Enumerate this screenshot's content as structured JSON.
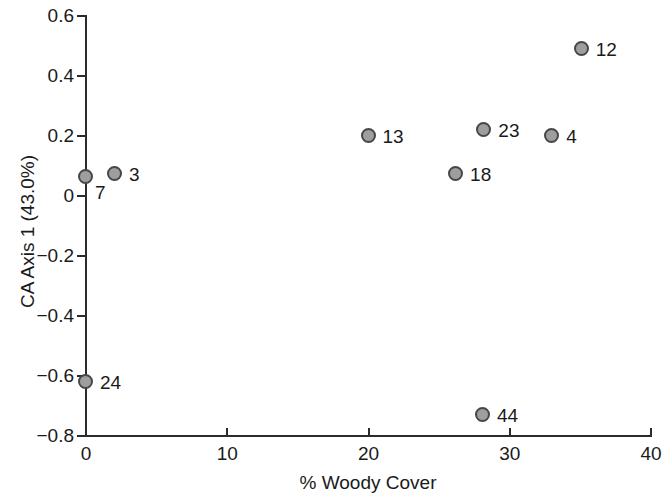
{
  "chart_data": {
    "type": "scatter",
    "title": "",
    "xlabel": "% Woody Cover",
    "ylabel": "CA Axis 1 (43.0%)",
    "xlim": [
      0,
      40
    ],
    "ylim": [
      -0.8,
      0.6
    ],
    "xticks": [
      "0",
      "10",
      "20",
      "30",
      "40"
    ],
    "xtick_values": [
      0,
      10,
      20,
      30,
      40
    ],
    "yticks": [
      "0.6",
      "0.4",
      "0.2",
      "0",
      "−0.2",
      "−0.4",
      "−0.6",
      "−0.8"
    ],
    "ytick_values": [
      0.6,
      0.4,
      0.2,
      0,
      -0.2,
      -0.4,
      -0.6,
      -0.8
    ],
    "grid": false,
    "legend": false,
    "marker_fill": "#9e9e9e",
    "marker_edge": "#474747",
    "points": [
      {
        "label": "7",
        "x": 0.0,
        "y": 0.065,
        "label_dx": 9,
        "label_dy": 6
      },
      {
        "label": "3",
        "x": 2.05,
        "y": 0.075,
        "label_dx": 14,
        "label_dy": -9
      },
      {
        "label": "24",
        "x": 0.0,
        "y": -0.62,
        "label_dx": 14,
        "label_dy": -9
      },
      {
        "label": "13",
        "x": 20.0,
        "y": 0.2,
        "label_dx": 14,
        "label_dy": -9
      },
      {
        "label": "18",
        "x": 26.2,
        "y": 0.075,
        "label_dx": 14,
        "label_dy": -9
      },
      {
        "label": "23",
        "x": 28.2,
        "y": 0.22,
        "label_dx": 14,
        "label_dy": -9
      },
      {
        "label": "4",
        "x": 33.0,
        "y": 0.2,
        "label_dx": 14,
        "label_dy": -9
      },
      {
        "label": "12",
        "x": 35.1,
        "y": 0.49,
        "label_dx": 14,
        "label_dy": -9
      },
      {
        "label": "44",
        "x": 28.1,
        "y": -0.73,
        "label_dx": 14,
        "label_dy": -9
      }
    ]
  }
}
